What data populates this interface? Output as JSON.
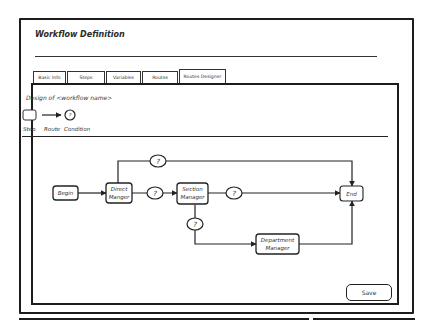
{
  "window": {
    "title": "Workflow Definition"
  },
  "tabs": [
    {
      "label": "Basic Info",
      "active": false
    },
    {
      "label": "Steps",
      "active": false
    },
    {
      "label": "Variables",
      "active": false
    },
    {
      "label": "Routes",
      "active": false
    },
    {
      "label": "Routes Designer",
      "active": true
    }
  ],
  "designer": {
    "title": "Design of <workflow name>",
    "legend": {
      "step": "Step",
      "route": "Route",
      "condition": "Condition",
      "condition_glyph": "?"
    },
    "nodes": {
      "begin": "Begin",
      "direct_manager_line1": "Direct",
      "direct_manager_line2": "Manger",
      "section_manager_line1": "Section",
      "section_manager_line2": "Manager",
      "department_manager_line1": "Department",
      "department_manager_line2": "Manager",
      "end": "End"
    },
    "conditions": {
      "c1": "?",
      "c2": "?",
      "c3": "?",
      "c4": "?"
    }
  },
  "actions": {
    "save_label": "Save"
  }
}
